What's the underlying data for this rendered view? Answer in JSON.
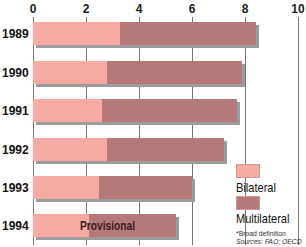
{
  "chart_data": {
    "type": "bar",
    "orientation": "horizontal",
    "stacked": true,
    "categories": [
      "1989",
      "1990",
      "1991",
      "1992",
      "1993",
      "1994"
    ],
    "series": [
      {
        "name": "Bilateral",
        "color": "#f7aaa4",
        "values": [
          3.3,
          2.8,
          2.6,
          2.8,
          2.5,
          2.1
        ]
      },
      {
        "name": "Multilateral",
        "color": "#b5787b",
        "values": [
          5.1,
          5.1,
          5.1,
          4.4,
          3.5,
          3.3
        ]
      }
    ],
    "totals": [
      8.4,
      7.9,
      7.7,
      7.2,
      6.0,
      5.4
    ],
    "xticks": [
      "0",
      "2",
      "4",
      "6",
      "8",
      "10"
    ],
    "xlim": [
      0,
      10
    ],
    "grid": true,
    "annotations": [
      {
        "category": "1994",
        "text": "Provisional"
      }
    ],
    "legend_position": "bottom-right",
    "footnote": "*Broad definition",
    "source": "Sources: FAO; OECD"
  },
  "legend": {
    "bilateral": "Bilateral",
    "multilateral": "Multilateral"
  },
  "notes": {
    "definition": "*Broad definition",
    "sources": "Sources: FAO; OECD"
  },
  "annotation": "Provisional"
}
